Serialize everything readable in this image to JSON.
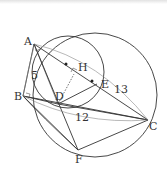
{
  "diagram": {
    "points": {
      "A": {
        "label": "A",
        "x": 34,
        "y": 44
      },
      "B": {
        "label": "B",
        "x": 23,
        "y": 96
      },
      "C": {
        "label": "C",
        "x": 148,
        "y": 120
      },
      "D": {
        "label": "D",
        "x": 58,
        "y": 104
      },
      "E": {
        "label": "E",
        "x": 97,
        "y": 84
      },
      "F": {
        "label": "F",
        "x": 78,
        "y": 150
      },
      "H": {
        "label": "H",
        "x": 78,
        "y": 69
      }
    },
    "lengths": {
      "AB": "5",
      "BC": "12",
      "AC": "13"
    },
    "circles": [
      {
        "name": "circumcircle",
        "cx": 95,
        "cy": 95,
        "r": 62
      },
      {
        "name": "inner-circle",
        "cx": 68,
        "cy": 72,
        "r": 36
      }
    ],
    "colors": {
      "stroke": "#333333",
      "arc": "#888888"
    }
  }
}
